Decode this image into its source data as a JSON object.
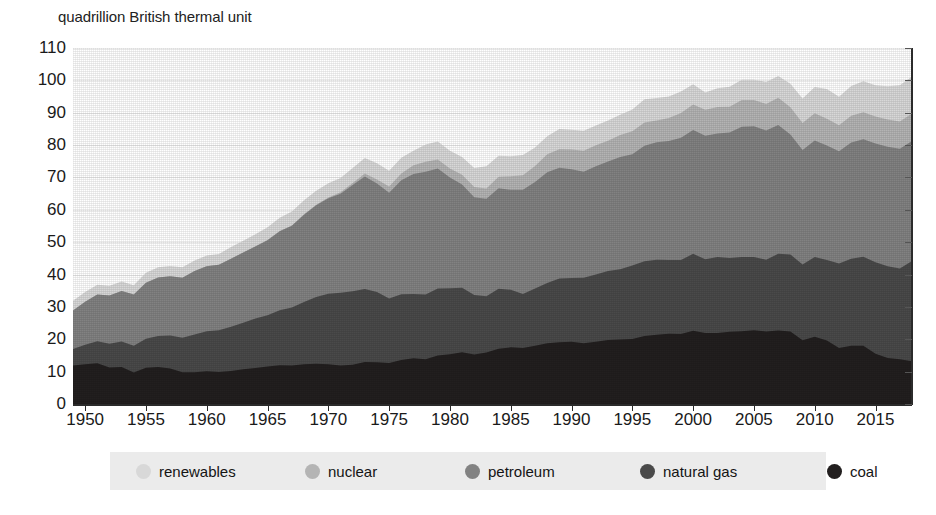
{
  "chart_data": {
    "type": "area",
    "stacked": true,
    "title": "quadrillion British thermal unit",
    "xlabel": "",
    "ylabel": "quadrillion British thermal unit",
    "xlim": [
      1949,
      2018
    ],
    "ylim": [
      0,
      110
    ],
    "ytick_step": 10,
    "grid": true,
    "legend_position": "bottom",
    "ytick_labels": [
      "110",
      "100",
      "90",
      "80",
      "70",
      "60",
      "50",
      "40",
      "30",
      "20",
      "10",
      "0"
    ],
    "ytick_values": [
      110,
      100,
      90,
      80,
      70,
      60,
      50,
      40,
      30,
      20,
      10,
      0
    ],
    "xtick_labels": [
      "1950",
      "1955",
      "1960",
      "1965",
      "1970",
      "1975",
      "1980",
      "1985",
      "1990",
      "1995",
      "2000",
      "2005",
      "2010",
      "2015"
    ],
    "xtick_values": [
      1950,
      1955,
      1960,
      1965,
      1970,
      1975,
      1980,
      1985,
      1990,
      1995,
      2000,
      2005,
      2010,
      2015
    ],
    "x": [
      1949,
      1950,
      1951,
      1952,
      1953,
      1954,
      1955,
      1956,
      1957,
      1958,
      1959,
      1960,
      1961,
      1962,
      1963,
      1964,
      1965,
      1966,
      1967,
      1968,
      1969,
      1970,
      1971,
      1972,
      1973,
      1974,
      1975,
      1976,
      1977,
      1978,
      1979,
      1980,
      1981,
      1982,
      1983,
      1984,
      1985,
      1986,
      1987,
      1988,
      1989,
      1990,
      1991,
      1992,
      1993,
      1994,
      1995,
      1996,
      1997,
      1998,
      1999,
      2000,
      2001,
      2002,
      2003,
      2004,
      2005,
      2006,
      2007,
      2008,
      2009,
      2010,
      2011,
      2012,
      2013,
      2014,
      2015,
      2016,
      2017,
      2018
    ],
    "series": [
      {
        "name": "coal",
        "color": "#221f1f",
        "values": [
          11.9,
          12.3,
          12.6,
          11.3,
          11.4,
          9.7,
          11.2,
          11.4,
          11.0,
          9.8,
          9.8,
          10.1,
          9.9,
          10.2,
          10.7,
          11.1,
          11.6,
          12.0,
          11.9,
          12.3,
          12.4,
          12.3,
          11.9,
          12.1,
          13.0,
          12.9,
          12.7,
          13.6,
          14.1,
          13.8,
          15.0,
          15.4,
          16.0,
          15.3,
          15.9,
          17.1,
          17.5,
          17.3,
          18.0,
          18.8,
          19.1,
          19.2,
          18.8,
          19.2,
          19.8,
          19.9,
          20.1,
          21.0,
          21.4,
          21.7,
          21.6,
          22.6,
          21.9,
          21.9,
          22.3,
          22.5,
          22.8,
          22.4,
          22.7,
          22.4,
          19.7,
          20.8,
          19.6,
          17.3,
          18.0,
          18.0,
          15.5,
          14.2,
          13.8,
          13.2
        ]
      },
      {
        "name": "natural gas",
        "color": "#4a4a4a",
        "values": [
          5.1,
          6.0,
          6.8,
          7.3,
          7.9,
          8.3,
          9.0,
          9.6,
          10.2,
          10.7,
          11.7,
          12.4,
          12.9,
          13.7,
          14.4,
          15.3,
          15.8,
          17.0,
          17.9,
          19.2,
          20.7,
          21.8,
          22.5,
          22.7,
          22.5,
          21.7,
          19.9,
          20.3,
          19.9,
          20.0,
          20.7,
          20.4,
          19.9,
          18.4,
          17.4,
          18.5,
          17.8,
          16.7,
          17.7,
          18.6,
          19.7,
          19.7,
          20.2,
          20.8,
          21.3,
          21.7,
          22.7,
          23.1,
          23.2,
          22.8,
          22.9,
          23.8,
          22.8,
          23.5,
          22.8,
          22.9,
          22.6,
          22.2,
          23.7,
          23.8,
          23.4,
          24.6,
          24.9,
          26.1,
          26.9,
          27.5,
          28.3,
          28.4,
          28.1,
          31.0
        ]
      },
      {
        "name": "petroleum",
        "color": "#828282",
        "values": [
          11.9,
          13.3,
          14.4,
          14.9,
          15.6,
          15.8,
          17.3,
          18.1,
          18.3,
          18.5,
          19.6,
          20.1,
          20.2,
          21.0,
          21.7,
          22.3,
          23.2,
          24.4,
          25.3,
          27.0,
          28.3,
          29.5,
          30.6,
          32.9,
          34.8,
          33.5,
          32.7,
          35.2,
          37.1,
          38.0,
          37.1,
          34.2,
          31.9,
          30.2,
          30.1,
          31.1,
          30.9,
          32.2,
          32.9,
          34.2,
          34.2,
          33.6,
          32.8,
          33.5,
          33.8,
          34.7,
          34.4,
          35.7,
          36.3,
          36.8,
          37.8,
          38.3,
          38.2,
          38.2,
          38.8,
          40.3,
          40.4,
          39.9,
          39.8,
          37.1,
          35.4,
          36.0,
          35.4,
          34.7,
          35.9,
          36.3,
          36.7,
          36.9,
          37.0,
          37.1
        ]
      },
      {
        "name": "nuclear",
        "color": "#b4b4b4",
        "values": [
          0,
          0,
          0,
          0,
          0,
          0,
          0,
          0,
          0,
          0,
          0,
          0.02,
          0.02,
          0.03,
          0.04,
          0.04,
          0.04,
          0.06,
          0.09,
          0.14,
          0.15,
          0.24,
          0.41,
          0.58,
          0.91,
          1.27,
          1.9,
          2.11,
          2.7,
          3.02,
          2.78,
          2.74,
          3.01,
          3.13,
          3.2,
          3.55,
          4.15,
          4.47,
          4.91,
          5.59,
          5.68,
          6.1,
          6.42,
          6.48,
          6.41,
          6.84,
          7.08,
          7.17,
          6.68,
          7.07,
          7.61,
          7.86,
          8.03,
          8.14,
          7.96,
          8.22,
          8.16,
          8.21,
          8.46,
          8.43,
          8.35,
          8.43,
          8.26,
          8.06,
          8.24,
          8.34,
          8.34,
          8.43,
          8.42,
          8.44
        ]
      },
      {
        "name": "renewables",
        "color": "#d8d8d8",
        "values": [
          2.97,
          2.98,
          3.07,
          3.04,
          2.97,
          2.88,
          3.04,
          3.17,
          3.12,
          3.29,
          3.26,
          3.29,
          3.35,
          3.55,
          3.61,
          3.72,
          3.94,
          4.11,
          4.29,
          4.32,
          4.34,
          4.38,
          4.45,
          4.61,
          4.8,
          5.03,
          4.91,
          4.85,
          4.43,
          5.39,
          5.54,
          5.49,
          5.48,
          5.86,
          6.85,
          6.49,
          6.17,
          6.27,
          5.73,
          5.58,
          6.26,
          6.13,
          6.21,
          6.08,
          6.26,
          6.23,
          6.69,
          7.17,
          6.98,
          6.61,
          6.65,
          6.26,
          5.33,
          5.84,
          6.15,
          6.26,
          6.23,
          6.8,
          6.72,
          7.19,
          7.57,
          8.09,
          9.14,
          8.78,
          9.25,
          9.59,
          9.65,
          10.25,
          11.14,
          11.49
        ]
      }
    ]
  },
  "legend": {
    "items": [
      {
        "label": "renewables",
        "color": "#d8d8d8"
      },
      {
        "label": "nuclear",
        "color": "#b4b4b4"
      },
      {
        "label": "petroleum",
        "color": "#828282"
      },
      {
        "label": "natural gas",
        "color": "#4a4a4a"
      },
      {
        "label": "coal",
        "color": "#221f1f"
      }
    ],
    "background": "#ebebeb"
  },
  "colors": {
    "background": "#ffffff",
    "axis": "#2b2b2b",
    "grid": "#ececec",
    "text": "#1a1a1a"
  }
}
